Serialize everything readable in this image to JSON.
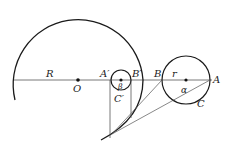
{
  "diagram": {
    "labels": {
      "R": "R",
      "O": "O",
      "A_prime": "A′",
      "B_prime": "B′",
      "beta": "β",
      "C_prime": "C′",
      "B": "B",
      "r": "r",
      "A": "A",
      "alpha": "α",
      "C": "C"
    },
    "colors": {
      "stroke": "#1a1a1a",
      "thin_stroke": "#555555"
    }
  }
}
